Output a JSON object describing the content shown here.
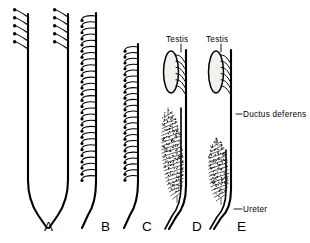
{
  "figure": {
    "kind": "line-drawing",
    "background_color": "#ffffff",
    "ink_color": "#000000",
    "width": 310,
    "height": 243
  },
  "callouts": [
    {
      "id": "testis-d",
      "text": "Testis",
      "x": 166,
      "y": 42,
      "leader": {
        "x1": 181,
        "y1": 44,
        "x2": 181,
        "y2": 52
      }
    },
    {
      "id": "testis-e",
      "text": "Testis",
      "x": 206,
      "y": 42,
      "leader": {
        "x1": 221,
        "y1": 44,
        "x2": 221,
        "y2": 52
      }
    },
    {
      "id": "ductus-deferens",
      "text": "Ductus deferens",
      "x": 243,
      "y": 117,
      "leader": {
        "x1": 236,
        "y1": 114,
        "x2": 242,
        "y2": 114
      }
    },
    {
      "id": "ureter",
      "text": "Ureter",
      "x": 243,
      "y": 212,
      "leader": {
        "x1": 234,
        "y1": 209,
        "x2": 242,
        "y2": 209
      }
    }
  ],
  "panel_letters": [
    {
      "id": "panel-a",
      "text": "A",
      "x": 44,
      "y": 231
    },
    {
      "id": "panel-b",
      "text": "B",
      "x": 101,
      "y": 231
    },
    {
      "id": "panel-c",
      "text": "C",
      "x": 142,
      "y": 231
    },
    {
      "id": "panel-d",
      "text": "D",
      "x": 192,
      "y": 231
    },
    {
      "id": "panel-e",
      "text": "E",
      "x": 237,
      "y": 231
    }
  ],
  "panels": [
    {
      "id": "A",
      "letter": "A",
      "description": "Archinephros: paired straight ducts joined in a U at the base, with a few anterior nephrostome tubules on each duct",
      "tubule_count": 10,
      "has_testis": false,
      "has_stipple_mass": false
    },
    {
      "id": "B",
      "letter": "B",
      "description": "Opisthonephros: single duct bearing tubules along its entire length",
      "tubule_count": 27,
      "has_testis": false,
      "has_stipple_mass": false
    },
    {
      "id": "C",
      "letter": "C",
      "description": "Tubules restricted to the posterior part of the duct",
      "tubule_count": 23,
      "has_testis": false,
      "has_stipple_mass": false
    },
    {
      "id": "D",
      "letter": "D",
      "description": "Testis connected to the anterior duct by efferent ductules; posterior stippled opisthonephric mass",
      "tubule_count": 6,
      "has_testis": true,
      "has_stipple_mass": true
    },
    {
      "id": "E",
      "letter": "E",
      "description": "Amniote condition: testis drains into the ductus deferens; separate kidney mass drained by a ureter",
      "tubule_count": 6,
      "has_testis": true,
      "has_stipple_mass": true
    }
  ]
}
